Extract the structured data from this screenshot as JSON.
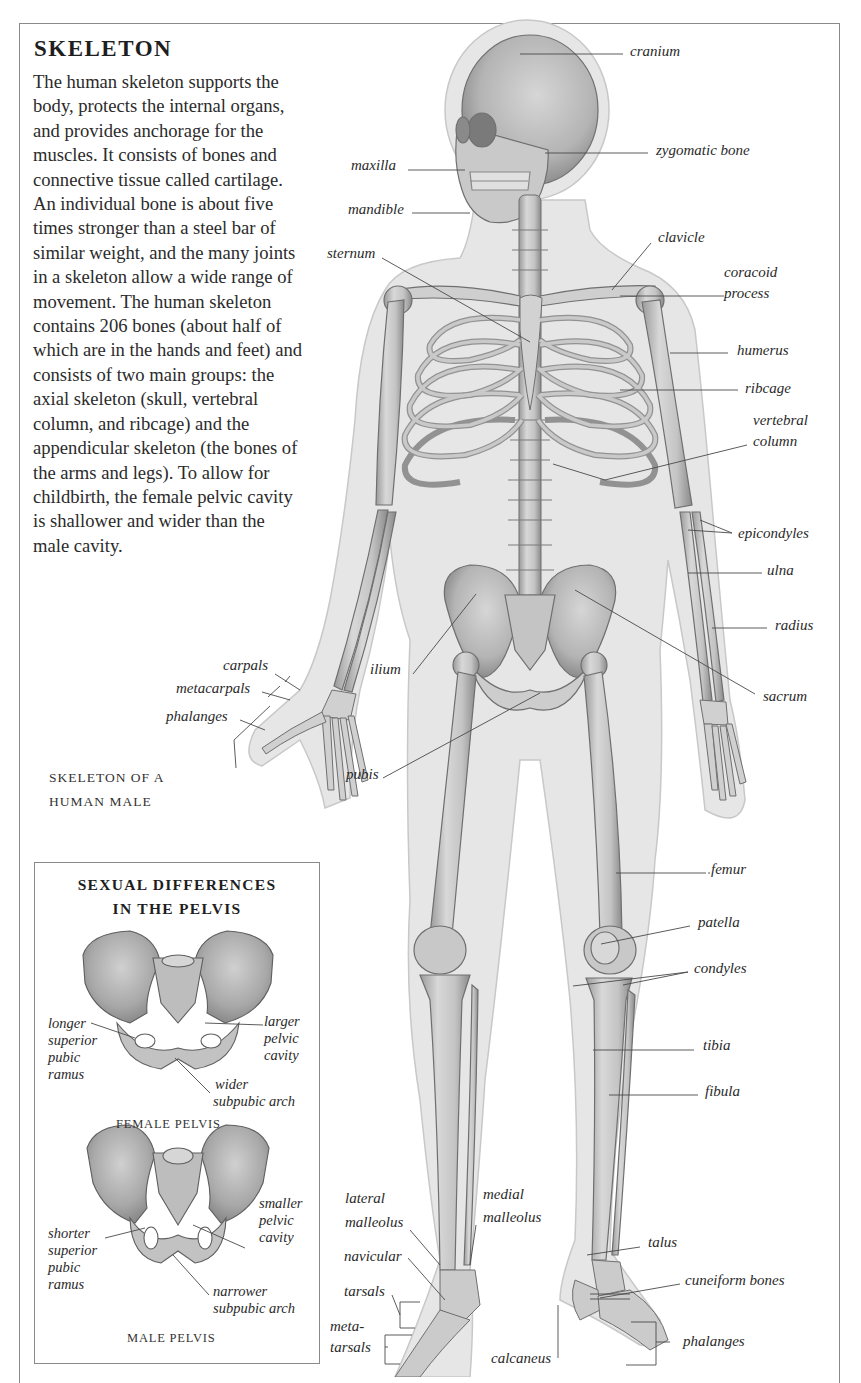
{
  "heading": {
    "title": "SKELETON",
    "intro": "The human skeleton supports the body, protects the internal organs, and provides anchorage for the muscles. It consists of bones and connective tissue called cartilage. An individual bone is about five times stronger than a steel bar of similar weight, and the many joints in a skeleton allow a wide range of movement. The human skeleton contains 206 bones (about half of which are in the hands and feet) and consists of two main groups: the axial skeleton (skull, vertebral column, and ribcage) and the appendicular skeleton (the bones of the arms and legs). To allow for childbirth, the female pelvic cavity is shallower and wider than the male cavity."
  },
  "figure": {
    "caption_line1": "SKELETON OF A",
    "caption_line2": "HUMAN MALE",
    "labels": {
      "cranium": "cranium",
      "zygomatic_bone": "zygomatic bone",
      "maxilla": "maxilla",
      "mandible": "mandible",
      "sternum": "sternum",
      "clavicle": "clavicle",
      "coracoid_process_1": "coracoid",
      "coracoid_process_2": "process",
      "humerus": "humerus",
      "ribcage": "ribcage",
      "vertebral_column_1": "vertebral",
      "vertebral_column_2": "column",
      "epicondyles": "epicondyles",
      "ulna": "ulna",
      "radius": "radius",
      "sacrum": "sacrum",
      "ilium": "ilium",
      "carpals": "carpals",
      "metacarpals": "metacarpals",
      "hand_phalanges": "phalanges",
      "pubis": "pubis",
      "femur": "femur",
      "patella": "patella",
      "condyles": "condyles",
      "tibia": "tibia",
      "fibula": "fibula",
      "lateral_malleolus_1": "lateral",
      "lateral_malleolus_2": "malleolus",
      "medial_malleolus_1": "medial",
      "medial_malleolus_2": "malleolus",
      "navicular": "navicular",
      "tarsals": "tarsals",
      "metatarsals_1": "meta-",
      "metatarsals_2": "tarsals",
      "calcaneus": "calcaneus",
      "talus": "talus",
      "cuneiform_bones": "cuneiform bones",
      "foot_phalanges": "phalanges"
    }
  },
  "inset": {
    "title_line1": "SEXUAL DIFFERENCES",
    "title_line2": "IN THE PELVIS",
    "female": {
      "caption": "FEMALE PELVIS",
      "label_left": [
        "longer",
        "superior",
        "pubic",
        "ramus"
      ],
      "label_right": [
        "larger",
        "pelvic",
        "cavity"
      ],
      "label_bottom": [
        "wider",
        "subpubic arch"
      ]
    },
    "male": {
      "caption": "MALE PELVIS",
      "label_left": [
        "shorter",
        "superior",
        "pubic",
        "ramus"
      ],
      "label_right": [
        "smaller",
        "pelvic",
        "cavity"
      ],
      "label_bottom": [
        "narrower",
        "subpubic arch"
      ]
    }
  },
  "colors": {
    "frame": "#8a8a8a",
    "skin": "#e4e4e4",
    "bone": "#cfcfcf",
    "bone_dark": "#8f8f8f",
    "text": "#2a2a2a"
  }
}
